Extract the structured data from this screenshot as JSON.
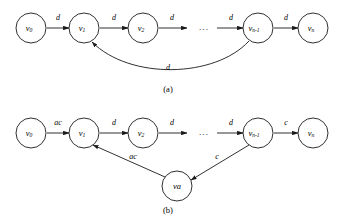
{
  "figure": {
    "background_color": "#ffffff",
    "stroke_color": "#1a1a1a",
    "width": 342,
    "height": 222
  },
  "panels": [
    {
      "id": "panel-a",
      "caption": "(a)",
      "caption_x": 168,
      "caption_y": 90,
      "ellipsis": "...",
      "ellipsis_x": 204,
      "ellipsis_y": 28,
      "nodes": [
        {
          "id": "a-v0",
          "base": "v",
          "sub": "0",
          "cx": 31,
          "cy": 28,
          "r": 15
        },
        {
          "id": "a-v1",
          "base": "v",
          "sub": "1",
          "cx": 84,
          "cy": 28,
          "r": 15
        },
        {
          "id": "a-v2",
          "base": "v",
          "sub": "2",
          "cx": 143,
          "cy": 28,
          "r": 15
        },
        {
          "id": "a-vn-1",
          "base": "v",
          "sub": "n-1",
          "cx": 258,
          "cy": 28,
          "r": 15
        },
        {
          "id": "a-vn",
          "base": "v",
          "sub": "n",
          "cx": 313,
          "cy": 28,
          "r": 15
        }
      ],
      "edges": [
        {
          "id": "a-e0",
          "from": "a-v0",
          "to": "a-v1",
          "label": "d",
          "label_x": 58,
          "label_y": 18,
          "x1": 47,
          "y1": 28,
          "x2": 69,
          "y2": 28
        },
        {
          "id": "a-e1",
          "from": "a-v1",
          "to": "a-v2",
          "label": "d",
          "label_x": 114,
          "label_y": 18,
          "x1": 100,
          "y1": 28,
          "x2": 128,
          "y2": 28
        },
        {
          "id": "a-e2",
          "from": "a-v2",
          "to": "dots",
          "label": "d",
          "label_x": 172,
          "label_y": 18,
          "x1": 159,
          "y1": 28,
          "x2": 187,
          "y2": 28
        },
        {
          "id": "a-e3",
          "from": "dots",
          "to": "a-vn-1",
          "label": "d",
          "label_x": 231,
          "label_y": 18,
          "x1": 217,
          "y1": 28,
          "x2": 243,
          "y2": 28
        },
        {
          "id": "a-e4",
          "from": "a-vn-1",
          "to": "a-vn",
          "label": "d",
          "label_x": 286,
          "label_y": 18,
          "x1": 274,
          "y1": 28,
          "x2": 298,
          "y2": 28
        }
      ],
      "back_edge": {
        "id": "a-back",
        "from": "a-vn-1",
        "to": "a-v1",
        "label": "d",
        "label_x": 168,
        "label_y": 68,
        "path": "M 249 41 C 215 78 130 80 92 42"
      }
    },
    {
      "id": "panel-b",
      "caption": "(b)",
      "caption_x": 168,
      "caption_y": 211,
      "ellipsis": "...",
      "ellipsis_x": 204,
      "ellipsis_y": 133,
      "nodes": [
        {
          "id": "b-v0",
          "base": "v",
          "sub": "0",
          "cx": 31,
          "cy": 133,
          "r": 15
        },
        {
          "id": "b-v1",
          "base": "v",
          "sub": "1",
          "cx": 84,
          "cy": 133,
          "r": 15
        },
        {
          "id": "b-v2",
          "base": "v",
          "sub": "2",
          "cx": 143,
          "cy": 133,
          "r": 15
        },
        {
          "id": "b-vn-1",
          "base": "v",
          "sub": "n-1",
          "cx": 258,
          "cy": 133,
          "r": 15
        },
        {
          "id": "b-vn",
          "base": "v",
          "sub": "n",
          "cx": 313,
          "cy": 133,
          "r": 15
        },
        {
          "id": "b-va",
          "base": "va",
          "sub": "",
          "cx": 177,
          "cy": 186,
          "r": 15
        }
      ],
      "edges": [
        {
          "id": "b-e0",
          "from": "b-v0",
          "to": "b-v1",
          "label": "ac",
          "label_x": 58,
          "label_y": 123,
          "x1": 47,
          "y1": 133,
          "x2": 69,
          "y2": 133
        },
        {
          "id": "b-e1",
          "from": "b-v1",
          "to": "b-v2",
          "label": "d",
          "label_x": 114,
          "label_y": 123,
          "x1": 100,
          "y1": 133,
          "x2": 128,
          "y2": 133
        },
        {
          "id": "b-e2",
          "from": "b-v2",
          "to": "dots",
          "label": "d",
          "label_x": 172,
          "label_y": 123,
          "x1": 159,
          "y1": 133,
          "x2": 187,
          "y2": 133
        },
        {
          "id": "b-e3",
          "from": "dots",
          "to": "b-vn-1",
          "label": "d",
          "label_x": 231,
          "label_y": 123,
          "x1": 217,
          "y1": 133,
          "x2": 243,
          "y2": 133
        },
        {
          "id": "b-e4",
          "from": "b-vn-1",
          "to": "b-vn",
          "label": "c",
          "label_x": 286,
          "label_y": 123,
          "x1": 274,
          "y1": 133,
          "x2": 298,
          "y2": 133
        }
      ],
      "diagonal_edges": [
        {
          "id": "b-d1",
          "from": "b-va",
          "to": "b-v1",
          "label": "ac",
          "label_x": 133,
          "label_y": 157,
          "x1": 165,
          "y1": 177,
          "x2": 93,
          "y2": 145
        },
        {
          "id": "b-d2",
          "from": "b-vn-1",
          "to": "b-va",
          "label": "c",
          "label_x": 217,
          "label_y": 157,
          "x1": 249,
          "y1": 145,
          "x2": 191,
          "y2": 180
        }
      ]
    }
  ]
}
